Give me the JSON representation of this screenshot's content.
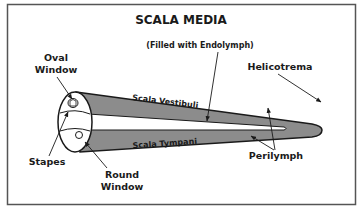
{
  "title": "SCALA MEDIA",
  "subtitle": "(Filled with Endolymph)",
  "labels": {
    "oval_window_line1": "Oval",
    "oval_window_line2": "Window",
    "helicotrema": "Helicotrema",
    "scala_vestibuli": "Scala Vestibuli",
    "scala_tympani": "Scala Tympani",
    "stapes": "Stapes",
    "round_window_line1": "Round",
    "round_window_line2": "Window",
    "perilymph": "Perilymph"
  },
  "colors": {
    "frame": "#555555",
    "tube_fill": "#8c8c8c",
    "outline": "#1a1a1a",
    "background": "#ffffff"
  }
}
